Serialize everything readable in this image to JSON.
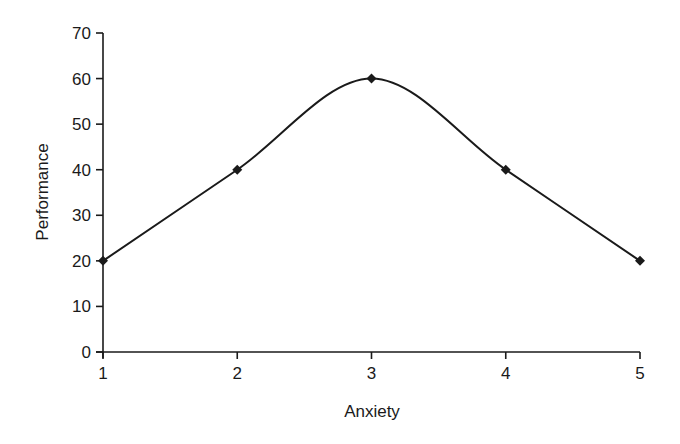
{
  "chart_data": {
    "type": "line",
    "title": "",
    "xlabel": "Anxiety",
    "ylabel": "Performance",
    "x": [
      1,
      2,
      3,
      4,
      5
    ],
    "categories": [
      "1",
      "2",
      "3",
      "4",
      "5"
    ],
    "series": [
      {
        "name": "Performance",
        "values": [
          20,
          40,
          60,
          40,
          20
        ],
        "marker": "diamond",
        "smooth": true,
        "color": "#1a1a1a"
      }
    ],
    "xlim": [
      1,
      5
    ],
    "ylim": [
      0,
      70
    ],
    "yticks": [
      0,
      10,
      20,
      30,
      40,
      50,
      60,
      70
    ],
    "xticks": [
      1,
      2,
      3,
      4,
      5
    ],
    "grid": false,
    "legend": null
  }
}
